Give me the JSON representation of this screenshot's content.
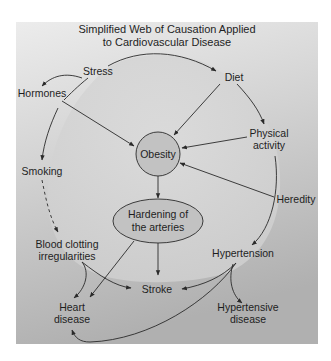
{
  "title": {
    "line1": "Simplified Web of Causation Applied",
    "line2": "to Cardiovascular Disease"
  },
  "nodes": {
    "stress": "Stress",
    "hormones": "Hormones",
    "diet": "Diet",
    "physical_activity": {
      "line1": "Physical",
      "line2": "activity"
    },
    "obesity": "Obesity",
    "smoking": "Smoking",
    "heredity": "Heredity",
    "hardening": {
      "line1": "Hardening of",
      "line2": "the arteries"
    },
    "blood_clotting": {
      "line1": "Blood clotting",
      "line2": "irregularities"
    },
    "hypertension": "Hypertension",
    "stroke": "Stroke",
    "heart_disease": {
      "line1": "Heart",
      "line2": "disease"
    },
    "hypertensive_disease": {
      "line1": "Hypertensive",
      "line2": "disease"
    }
  },
  "edges": [
    {
      "from": "Stress",
      "to": "Diet",
      "style": "solid"
    },
    {
      "from": "Stress",
      "to": "Hormones",
      "style": "solid"
    },
    {
      "from": "Hormones",
      "to": "Obesity",
      "style": "solid"
    },
    {
      "from": "Hormones",
      "to": "Smoking",
      "style": "solid"
    },
    {
      "from": "Diet",
      "to": "Obesity",
      "style": "solid"
    },
    {
      "from": "Diet",
      "to": "Physical activity",
      "style": "solid"
    },
    {
      "from": "Physical activity",
      "to": "Obesity",
      "style": "solid"
    },
    {
      "from": "Heredity",
      "to": "Obesity",
      "style": "solid"
    },
    {
      "from": "Physical activity",
      "to": "Hypertension",
      "style": "solid"
    },
    {
      "from": "Smoking",
      "to": "Blood clotting irregularities",
      "style": "dashed"
    },
    {
      "from": "Obesity",
      "to": "Hardening of the arteries",
      "style": "solid"
    },
    {
      "from": "Hardening of the arteries",
      "to": "Stroke",
      "style": "solid"
    },
    {
      "from": "Hardening of the arteries",
      "to": "Heart disease",
      "style": "solid"
    },
    {
      "from": "Blood clotting irregularities",
      "to": "Heart disease",
      "style": "solid"
    },
    {
      "from": "Blood clotting irregularities",
      "to": "Stroke",
      "style": "solid"
    },
    {
      "from": "Hypertension",
      "to": "Stroke",
      "style": "solid"
    },
    {
      "from": "Hypertension",
      "to": "Hypertensive disease",
      "style": "solid"
    },
    {
      "from": "Hypertension",
      "to": "Heart disease",
      "style": "solid"
    }
  ],
  "colors": {
    "panel_light": "#e6e6e6",
    "panel_dark": "#b2b2b2",
    "inner_region": "#d6d6d6",
    "node_fill": "#c2c2c2",
    "stroke": "#2a2a2a"
  }
}
